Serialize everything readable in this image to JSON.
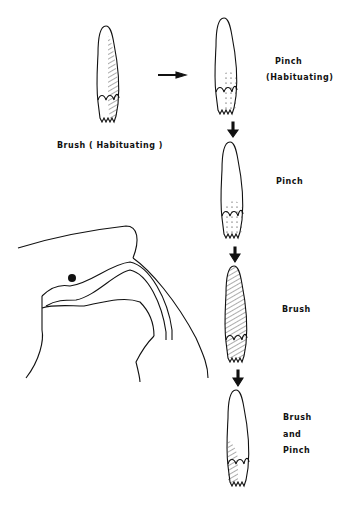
{
  "labels": {
    "brush_habituating": "Brush ( Habituating )",
    "pinch_habituating_1": "Pinch",
    "pinch_habituating_2": "(Habituating)",
    "pinch": "Pinch",
    "brush": "Brush",
    "brush_and_pinch_1": "Brush",
    "brush_and_pinch_2": "and",
    "brush_and_pinch_3": "Pinch"
  },
  "colors": {
    "line": "#111111",
    "background": "#ffffff"
  }
}
